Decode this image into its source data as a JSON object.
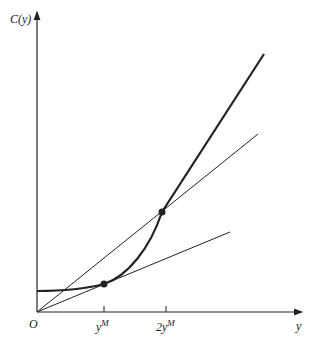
{
  "diagram": {
    "axes": {
      "y_axis_label": "C(y)",
      "x_axis_label": "y",
      "origin_label": "O"
    },
    "ticks": [
      {
        "base": "y",
        "sup": "M"
      },
      {
        "base": "2y",
        "sup": "M"
      }
    ],
    "elements": [
      {
        "name": "cost-curve",
        "desc": "C(y): flat then convex, steep beyond 2y^M"
      },
      {
        "name": "ray-through-2yM",
        "desc": "ray from origin through point at 2y^M"
      },
      {
        "name": "tangent-at-yM",
        "desc": "ray from origin tangent at y^M"
      },
      {
        "name": "point-yM"
      },
      {
        "name": "point-2yM"
      }
    ],
    "colors": {
      "line": "#222222",
      "background": "#ffffff"
    }
  }
}
